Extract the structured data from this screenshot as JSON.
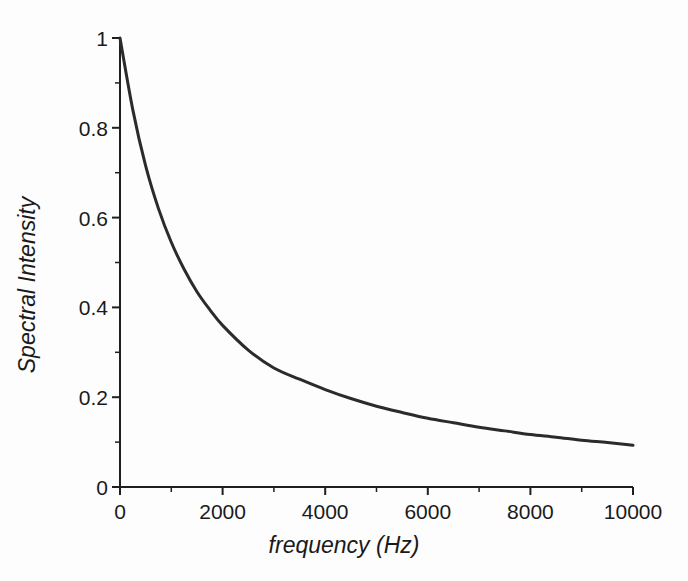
{
  "chart_data": {
    "type": "line",
    "title": "",
    "xlabel": "frequency (Hz)",
    "ylabel": "Spectral Intensity",
    "xlim": [
      0,
      10000
    ],
    "ylim": [
      0,
      1
    ],
    "grid": false,
    "legend": null,
    "xticks": [
      0,
      2000,
      4000,
      6000,
      8000,
      10000
    ],
    "xtick_labels": [
      "0",
      "2000",
      "4000",
      "6000",
      "8000",
      "10000"
    ],
    "yticks": [
      0,
      0.2,
      0.4,
      0.6,
      0.8,
      1
    ],
    "ytick_labels": [
      "0",
      "0.2",
      "0.4",
      "0.6",
      "0.8",
      "1"
    ],
    "minor_xticks": [
      1000,
      3000,
      5000,
      7000,
      9000
    ],
    "minor_yticks": [
      0.1,
      0.3,
      0.5,
      0.7,
      0.9
    ],
    "line_color": "#2b2b2b",
    "line_width": 3.0,
    "series": [
      {
        "name": "Spectral Intensity",
        "x": [
          0,
          250,
          500,
          750,
          1000,
          1250,
          1500,
          1750,
          2000,
          2500,
          3000,
          3500,
          4000,
          4500,
          5000,
          5500,
          6000,
          6500,
          7000,
          7500,
          8000,
          8500,
          9000,
          9500,
          10000
        ],
        "values": [
          1.0,
          0.84,
          0.715,
          0.62,
          0.545,
          0.485,
          0.435,
          0.395,
          0.36,
          0.305,
          0.265,
          0.24,
          0.217,
          0.197,
          0.18,
          0.166,
          0.153,
          0.143,
          0.133,
          0.125,
          0.117,
          0.111,
          0.104,
          0.099,
          0.093
        ]
      }
    ]
  },
  "axes": {
    "x_origin_px": 120,
    "x_end_px": 633,
    "y_origin_px": 487,
    "y_top_px": 38
  }
}
